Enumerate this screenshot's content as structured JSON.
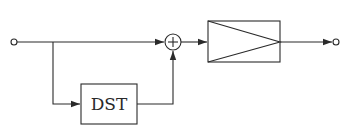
{
  "diagram": {
    "type": "block-diagram",
    "colors": {
      "stroke": "#2a2a2a",
      "background": "#ffffff"
    },
    "nodes": [
      {
        "id": "input",
        "kind": "terminal",
        "label": ""
      },
      {
        "id": "dst",
        "kind": "block",
        "label": "DST"
      },
      {
        "id": "sum",
        "kind": "summing-junction",
        "label": "+"
      },
      {
        "id": "amp",
        "kind": "amplifier-block",
        "label": ""
      },
      {
        "id": "output",
        "kind": "terminal",
        "label": ""
      }
    ],
    "edges": [
      {
        "from": "input",
        "to": "sum"
      },
      {
        "from": "input",
        "to": "dst"
      },
      {
        "from": "dst",
        "to": "sum"
      },
      {
        "from": "sum",
        "to": "amp"
      },
      {
        "from": "amp",
        "to": "output"
      }
    ]
  }
}
